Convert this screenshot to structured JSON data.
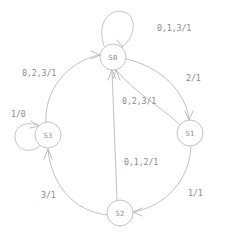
{
  "diagram": {
    "machine_type": "mealy",
    "label_format": "input/output",
    "background_color": "#ffffff",
    "line_color": "#bcbcbc",
    "text_color": "#8a8a8a",
    "states": [
      {
        "id": "S0",
        "label": "S0",
        "cx": 113,
        "cy": 57,
        "r": 13
      },
      {
        "id": "S1",
        "label": "S1",
        "cx": 190,
        "cy": 133,
        "r": 13
      },
      {
        "id": "S2",
        "label": "S2",
        "cx": 120,
        "cy": 213,
        "r": 13
      },
      {
        "id": "S3",
        "label": "S3",
        "cx": 48,
        "cy": 135,
        "r": 13
      }
    ],
    "transitions": [
      {
        "id": "s0-self",
        "from": "S0",
        "to": "S0",
        "kind": "self-loop",
        "label": "0,1,3/1",
        "inputs": "0,1,3",
        "output": "1",
        "label_x": 157,
        "label_y": 28,
        "label_anchor": "start"
      },
      {
        "id": "s0-to-s1",
        "from": "S0",
        "to": "S1",
        "kind": "curve",
        "label": "2/1",
        "inputs": "2",
        "output": "1",
        "label_x": 186,
        "label_y": 78,
        "label_anchor": "start"
      },
      {
        "id": "s1-to-s0",
        "from": "S1",
        "to": "S0",
        "kind": "curve",
        "label": "0,2,3/1",
        "inputs": "0,2,3",
        "output": "1",
        "label_x": 122,
        "label_y": 101,
        "label_anchor": "start"
      },
      {
        "id": "s1-to-s2",
        "from": "S1",
        "to": "S2",
        "kind": "curve",
        "label": "1/1",
        "inputs": "1",
        "output": "1",
        "label_x": 188,
        "label_y": 193,
        "label_anchor": "start"
      },
      {
        "id": "s2-to-s0",
        "from": "S2",
        "to": "S0",
        "kind": "line",
        "label": "0,1,2/1",
        "inputs": "0,1,2",
        "output": "1",
        "label_x": 124,
        "label_y": 162,
        "label_anchor": "start"
      },
      {
        "id": "s2-to-s3",
        "from": "S2",
        "to": "S3",
        "kind": "curve",
        "label": "3/1",
        "inputs": "3",
        "output": "1",
        "label_x": 41,
        "label_y": 195,
        "label_anchor": "start"
      },
      {
        "id": "s3-to-s0",
        "from": "S3",
        "to": "S0",
        "kind": "curve",
        "label": "0,2,3/1",
        "inputs": "0,2,3",
        "output": "1",
        "label_x": 22,
        "label_y": 73,
        "label_anchor": "start"
      },
      {
        "id": "s3-self",
        "from": "S3",
        "to": "S3",
        "kind": "self-loop",
        "label": "1/0",
        "inputs": "1",
        "output": "0",
        "label_x": 11,
        "label_y": 114,
        "label_anchor": "start"
      }
    ]
  }
}
